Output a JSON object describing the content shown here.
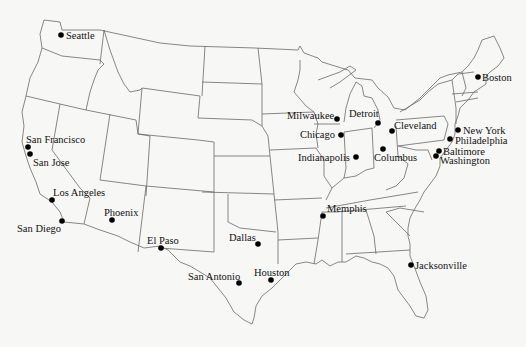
{
  "map": {
    "title": "United States Major Cities",
    "background": "#f7f7f5",
    "border_color": "#6a6a6a",
    "dot_color": "#000000",
    "cities": [
      {
        "name": "Seattle",
        "x": 61,
        "y": 35,
        "lx": 66,
        "ly": 39
      },
      {
        "name": "San Francisco",
        "x": 28,
        "y": 147,
        "lx": 26,
        "ly": 143
      },
      {
        "name": "San Jose",
        "x": 30,
        "y": 154,
        "lx": 33,
        "ly": 166
      },
      {
        "name": "Los Angeles",
        "x": 52,
        "y": 200,
        "lx": 53,
        "ly": 196
      },
      {
        "name": "San Diego",
        "x": 62,
        "y": 221,
        "lx": 17,
        "ly": 232
      },
      {
        "name": "Phoenix",
        "x": 112,
        "y": 220,
        "lx": 104,
        "ly": 216
      },
      {
        "name": "El Paso",
        "x": 161,
        "y": 248,
        "lx": 147,
        "ly": 244
      },
      {
        "name": "Dallas",
        "x": 258,
        "y": 244,
        "lx": 229,
        "ly": 241
      },
      {
        "name": "San Antonio",
        "x": 239,
        "y": 283,
        "lx": 188,
        "ly": 280
      },
      {
        "name": "Houston",
        "x": 271,
        "y": 280,
        "lx": 254,
        "ly": 276
      },
      {
        "name": "Memphis",
        "x": 323,
        "y": 216,
        "lx": 327,
        "ly": 212
      },
      {
        "name": "Jacksonville",
        "x": 411,
        "y": 265,
        "lx": 415,
        "ly": 269
      },
      {
        "name": "Milwaukee",
        "x": 337,
        "y": 119,
        "lx": 287,
        "ly": 119
      },
      {
        "name": "Chicago",
        "x": 341,
        "y": 135,
        "lx": 300,
        "ly": 138
      },
      {
        "name": "Indianapolis",
        "x": 356,
        "y": 157,
        "lx": 298,
        "ly": 161
      },
      {
        "name": "Detroit",
        "x": 378,
        "y": 123,
        "lx": 349,
        "ly": 117
      },
      {
        "name": "Cleveland",
        "x": 392,
        "y": 131,
        "lx": 394,
        "ly": 129
      },
      {
        "name": "Columbus",
        "x": 383,
        "y": 149,
        "lx": 374,
        "ly": 161
      },
      {
        "name": "Boston",
        "x": 478,
        "y": 77,
        "lx": 482,
        "ly": 81
      },
      {
        "name": "New York",
        "x": 458,
        "y": 130,
        "lx": 463,
        "ly": 134
      },
      {
        "name": "Philadelphia",
        "x": 450,
        "y": 139,
        "lx": 455,
        "ly": 144
      },
      {
        "name": "Baltimore",
        "x": 439,
        "y": 151,
        "lx": 443,
        "ly": 155
      },
      {
        "name": "Washington",
        "x": 436,
        "y": 156,
        "lx": 440,
        "ly": 164
      }
    ]
  }
}
